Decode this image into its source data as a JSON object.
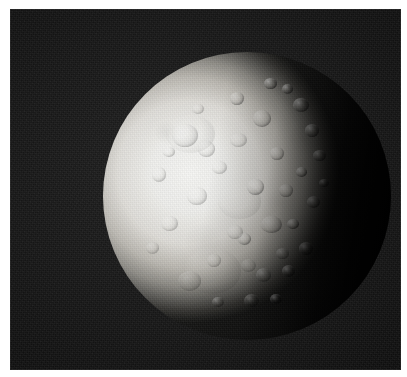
{
  "image": {
    "kind": "spacecraft-photograph",
    "subject": "icy cratered moon",
    "color_mode": "grayscale",
    "caption": "",
    "alt_text": "Grayscale spacecraft photograph of a heavily cratered icy moon, lit from the left, with the night side in shadow on the right",
    "canvas": {
      "width": 407,
      "height": 377,
      "background": "#ffffff"
    },
    "plate": {
      "x": 10,
      "y": 9,
      "width": 391,
      "height": 361,
      "sky_color": "#1b1b1b",
      "noise": "film-grain"
    },
    "moon": {
      "center_x": 247,
      "center_y": 196,
      "radius": 144,
      "illumination": "waning-gibbous",
      "light_direction": "left",
      "terminator_x": 295,
      "highlight_color": "#f7f7f5",
      "midtone_color": "#c9c7c1",
      "shadow_color": "#161615",
      "surface": "heavily cratered icy regolith"
    },
    "labels": {
      "title": "",
      "credit": "",
      "scale_bar": ""
    }
  }
}
